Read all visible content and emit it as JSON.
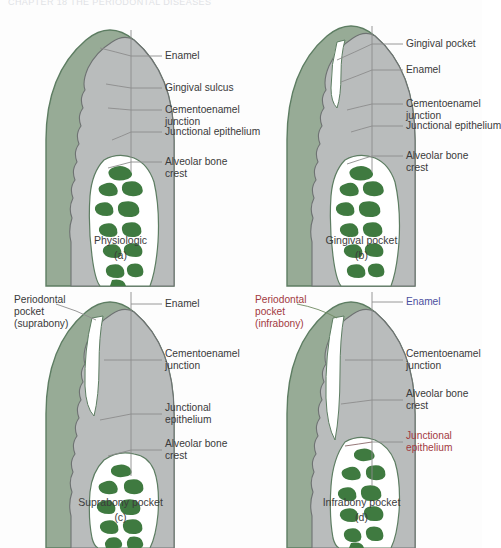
{
  "page": {
    "running_head": "CHAPTER 18     THE PERIODONTAL DISEASES"
  },
  "colors": {
    "gingiva_fill": "#97ab96",
    "gingiva_stroke": "#5d7d62",
    "tooth_fill": "#b9bcbc",
    "tooth_stroke": "#6e7272",
    "bone_fill": "#3f7a40",
    "ligament_fill": "#ffffff",
    "leader_line": "#8c8c8c",
    "label_text": "#3a3a3a",
    "label_red": "#a23a3f",
    "label_blue": "#4b4f9e",
    "label_green": "#4d7a52"
  },
  "panels": [
    {
      "id": "a",
      "caption_name": "Physiologic",
      "caption_letter": "(a)",
      "labels": [
        {
          "id": "enamel",
          "text": "Enamel",
          "line2": "",
          "color": "default"
        },
        {
          "id": "gingival-sulcus",
          "text": "Gingival sulcus",
          "line2": "",
          "color": "default"
        },
        {
          "id": "cej",
          "text": "Cementoenamel",
          "line2": "junction",
          "color": "default"
        },
        {
          "id": "junctional-epithelium",
          "text": "Junctional epithelium",
          "line2": "",
          "color": "default"
        },
        {
          "id": "alveolar-bone-crest",
          "text": "Alveolar bone",
          "line2": "crest",
          "color": "default"
        }
      ]
    },
    {
      "id": "b",
      "caption_name": "Gingival pocket",
      "caption_letter": "(b)",
      "labels": [
        {
          "id": "gingival-pocket",
          "text": "Gingival pocket",
          "line2": "",
          "color": "default"
        },
        {
          "id": "enamel",
          "text": "Enamel",
          "line2": "",
          "color": "default"
        },
        {
          "id": "cej",
          "text": "Cementoenamel",
          "line2": "junction",
          "color": "default"
        },
        {
          "id": "junctional-epithelium",
          "text": "Junctional epithelium",
          "line2": "",
          "color": "default"
        },
        {
          "id": "alveolar-bone-crest",
          "text": "Alveolar bone",
          "line2": "crest",
          "color": "default"
        }
      ]
    },
    {
      "id": "c",
      "caption_name": "Suprabony pocket",
      "caption_letter": "(c)",
      "labels": [
        {
          "id": "periodontal-pocket",
          "text": "Periodontal",
          "line2": "pocket",
          "line3": "(suprabony)",
          "color": "default"
        },
        {
          "id": "enamel",
          "text": "Enamel",
          "line2": "",
          "color": "default"
        },
        {
          "id": "cej",
          "text": "Cementoenamel",
          "line2": "junction",
          "color": "default"
        },
        {
          "id": "junctional-epithelium",
          "text": "Junctional",
          "line2": "epithelium",
          "color": "default"
        },
        {
          "id": "alveolar-bone-crest",
          "text": "Alveolar bone",
          "line2": "crest",
          "color": "default"
        }
      ]
    },
    {
      "id": "d",
      "caption_name": "Infrabony pocket",
      "caption_letter": "(d)",
      "labels": [
        {
          "id": "periodontal-pocket",
          "text": "Periodontal",
          "line2": "pocket",
          "line3": "(infrabony)",
          "color": "red"
        },
        {
          "id": "enamel",
          "text": "Enamel",
          "line2": "",
          "color": "blue"
        },
        {
          "id": "cej",
          "text": "Cementoenamel",
          "line2": "junction",
          "color": "default"
        },
        {
          "id": "alveolar-bone-crest",
          "text": "Alveolar bone",
          "line2": "crest",
          "color": "default"
        },
        {
          "id": "junctional-epithelium",
          "text": "Junctional",
          "line2": "epithelium",
          "color": "red"
        }
      ]
    }
  ]
}
